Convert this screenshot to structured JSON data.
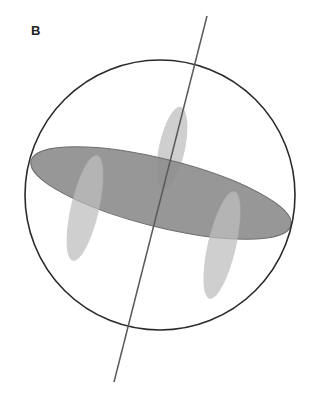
{
  "panel": {
    "label": "B"
  },
  "diagram": {
    "colors": {
      "sphere_outline": "#2a2a2a",
      "disc_fill": "#8e8e8e",
      "disc_edge": "#6e6e6e",
      "lobe_fill": "#cfcfcf",
      "axis_line": "#5a5a5a"
    }
  }
}
